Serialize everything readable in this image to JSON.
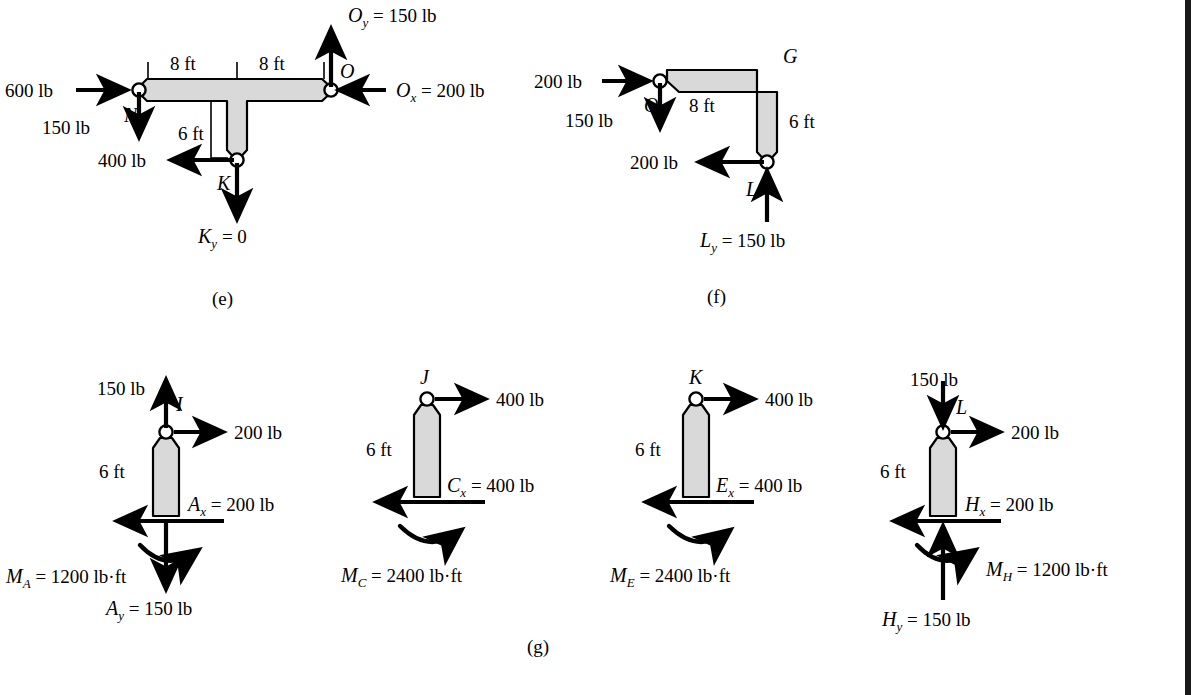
{
  "page": {
    "background_color": "#ffffff",
    "border_color": "#1a1a1a",
    "member_fill": "#d9d9d9",
    "member_stroke": "#000000",
    "cut_text_top": "",
    "captions": {
      "e": "(e)",
      "f": "(f)",
      "g": "(g)"
    }
  },
  "diagram_e": {
    "caption": "(e)",
    "shape": "T-shaped member",
    "joints": [
      {
        "name": "N",
        "label": "N"
      },
      {
        "name": "O",
        "label": "O"
      },
      {
        "name": "K",
        "label": "K"
      }
    ],
    "dimensions": [
      {
        "name": "left-span",
        "label": "8 ft"
      },
      {
        "name": "right-span",
        "label": "8 ft"
      },
      {
        "name": "stem",
        "label": "6 ft"
      }
    ],
    "forces": [
      {
        "name": "applied-600",
        "label": "600 lb",
        "direction": "right",
        "at": "N"
      },
      {
        "name": "applied-150-at-N",
        "label": "150 lb",
        "direction": "down",
        "at": "N"
      },
      {
        "name": "applied-400-at-K",
        "label": "400 lb",
        "direction": "left",
        "at": "K"
      },
      {
        "name": "reaction-Ky",
        "label": "K_y = 0",
        "label_base": "K",
        "label_sub": "y",
        "label_rest": " = 0",
        "direction": "down",
        "at": "K"
      },
      {
        "name": "reaction-Oy",
        "label": "O_y = 150 lb",
        "label_base": "O",
        "label_sub": "y",
        "label_rest": " = 150 lb",
        "direction": "up",
        "at": "O"
      },
      {
        "name": "reaction-Ox",
        "label": "O_x = 200 lb",
        "label_base": "O",
        "label_sub": "x",
        "label_rest": " = 200 lb",
        "direction": "left",
        "at": "O"
      }
    ]
  },
  "diagram_f": {
    "caption": "(f)",
    "shape": "L-shaped bent member",
    "joints": [
      {
        "name": "O",
        "label": "O"
      },
      {
        "name": "G",
        "label": "G"
      },
      {
        "name": "L",
        "label": "L"
      }
    ],
    "dimensions": [
      {
        "name": "horizontal-span",
        "label": "8 ft"
      },
      {
        "name": "vertical-span",
        "label": "6 ft"
      }
    ],
    "forces": [
      {
        "name": "applied-200-at-O",
        "label": "200 lb",
        "direction": "right",
        "at": "O"
      },
      {
        "name": "applied-150-at-O",
        "label": "150 lb",
        "direction": "down",
        "at": "O"
      },
      {
        "name": "applied-200-at-L",
        "label": "200 lb",
        "direction": "left",
        "at": "L"
      },
      {
        "name": "reaction-Ly",
        "label": "L_y = 150 lb",
        "label_base": "L",
        "label_sub": "y",
        "label_rest": " = 150 lb",
        "direction": "up",
        "at": "L"
      }
    ]
  },
  "diagram_g": {
    "caption": "(g)",
    "members": [
      {
        "name": "member-IA",
        "top_joint": "I",
        "dimension": "6 ft",
        "forces": [
          {
            "name": "applied-150-up",
            "label": "150 lb",
            "direction": "up"
          },
          {
            "name": "applied-200-right",
            "label": "200 lb",
            "direction": "right"
          },
          {
            "name": "reaction-Ax",
            "label": "A_x = 200 lb",
            "label_base": "A",
            "label_sub": "x",
            "label_rest": " = 200 lb",
            "direction": "left"
          },
          {
            "name": "reaction-Ay",
            "label": "A_y = 150 lb",
            "label_base": "A",
            "label_sub": "y",
            "label_rest": " = 150 lb",
            "direction": "down"
          }
        ],
        "moment": {
          "name": "moment-MA",
          "label": "M_A = 1200 lb·ft",
          "label_base": "M",
          "label_sub": "A",
          "label_rest": " = 1200 lb·ft",
          "sense": "counterclockwise-arc"
        }
      },
      {
        "name": "member-JC",
        "top_joint": "J",
        "dimension": "6 ft",
        "forces": [
          {
            "name": "applied-400-right",
            "label": "400 lb",
            "direction": "right"
          },
          {
            "name": "reaction-Cx",
            "label": "C_x = 400 lb",
            "label_base": "C",
            "label_sub": "x",
            "label_rest": " = 400 lb",
            "direction": "left"
          }
        ],
        "moment": {
          "name": "moment-MC",
          "label": "M_C = 2400 lb·ft",
          "label_base": "M",
          "label_sub": "C",
          "label_rest": " = 2400 lb·ft",
          "sense": "counterclockwise-arc"
        }
      },
      {
        "name": "member-KE",
        "top_joint": "K",
        "dimension": "6 ft",
        "forces": [
          {
            "name": "applied-400-right",
            "label": "400 lb",
            "direction": "right"
          },
          {
            "name": "reaction-Ex",
            "label": "E_x = 400 lb",
            "label_base": "E",
            "label_sub": "x",
            "label_rest": " = 400 lb",
            "direction": "left"
          }
        ],
        "moment": {
          "name": "moment-ME",
          "label": "M_E = 2400 lb·ft",
          "label_base": "M",
          "label_sub": "E",
          "label_rest": " = 2400 lb·ft",
          "sense": "counterclockwise-arc"
        }
      },
      {
        "name": "member-LH",
        "top_joint": "L",
        "dimension": "6 ft",
        "forces": [
          {
            "name": "applied-150-down",
            "label": "150 lb",
            "direction": "down"
          },
          {
            "name": "applied-200-right",
            "label": "200 lb",
            "direction": "right"
          },
          {
            "name": "reaction-Hx",
            "label": "H_x = 200 lb",
            "label_base": "H",
            "label_sub": "x",
            "label_rest": " = 200 lb",
            "direction": "left"
          },
          {
            "name": "reaction-Hy",
            "label": "H_y = 150 lb",
            "label_base": "H",
            "label_sub": "y",
            "label_rest": " = 150 lb",
            "direction": "up"
          }
        ],
        "moment": {
          "name": "moment-MH",
          "label": "M_H = 1200 lb·ft",
          "label_base": "M",
          "label_sub": "H",
          "label_rest": " = 1200 lb·ft",
          "sense": "counterclockwise-arc"
        }
      }
    ]
  }
}
